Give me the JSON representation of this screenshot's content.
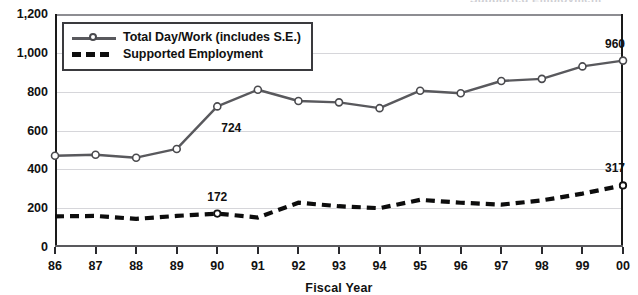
{
  "title_fragment": "Supported Employment",
  "chart_data": {
    "type": "line",
    "title": "",
    "xlabel": "Fiscal Year",
    "ylabel": "",
    "ylim": [
      0,
      1200
    ],
    "ytick_values": [
      0,
      200,
      400,
      600,
      800,
      1000,
      1200
    ],
    "ytick_labels": [
      "0",
      "200",
      "400",
      "600",
      "800",
      "1,000",
      "1,200"
    ],
    "grid": true,
    "legend_position": "top-left",
    "categories": [
      "86",
      "87",
      "88",
      "89",
      "90",
      "91",
      "92",
      "93",
      "94",
      "95",
      "96",
      "97",
      "98",
      "99",
      "00"
    ],
    "series": [
      {
        "name": "Total Day/Work (includes S.E.)",
        "style": "solid-with-markers",
        "color": "#59595d",
        "values": [
          470,
          475,
          460,
          505,
          724,
          810,
          752,
          745,
          715,
          805,
          792,
          855,
          866,
          930,
          960
        ]
      },
      {
        "name": "Supported Employment",
        "style": "dashed",
        "color": "#0d0d0d",
        "values": [
          158,
          160,
          145,
          160,
          172,
          152,
          228,
          210,
          200,
          243,
          228,
          218,
          240,
          275,
          317
        ]
      }
    ],
    "point_labels": [
      {
        "series": "Total Day/Work (includes S.E.)",
        "category": "90",
        "value": 724,
        "text": "724"
      },
      {
        "series": "Supported Employment",
        "category": "90",
        "value": 172,
        "text": "172"
      },
      {
        "series": "Total Day/Work (includes S.E.)",
        "category": "00",
        "value": 960,
        "text": "960"
      },
      {
        "series": "Supported Employment",
        "category": "00",
        "value": 317,
        "text": "317"
      }
    ]
  },
  "legend": {
    "items": [
      {
        "label": "Total Day/Work (includes S.E.)",
        "key": "line-marker-key"
      },
      {
        "label": "Supported Employment",
        "key": "dashed-line-key"
      }
    ]
  }
}
